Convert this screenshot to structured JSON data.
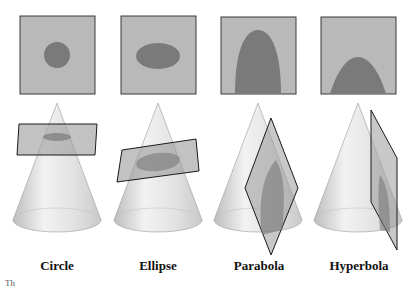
{
  "colors": {
    "panel_fill": "#b9b9b9",
    "panel_border": "#3a3a3a",
    "section_fill": "#7a7a7a",
    "cone_light": "#efefef",
    "cone_dark": "#c4c4c4",
    "plane_fill": "#9a9a9a",
    "plane_border": "#1a1a1a"
  },
  "sections": [
    {
      "id": "circle",
      "label": "Circle"
    },
    {
      "id": "ellipse",
      "label": "Ellipse"
    },
    {
      "id": "parabola",
      "label": "Parabola"
    },
    {
      "id": "hyperbola",
      "label": "Hyperbola"
    }
  ],
  "footer_stub": "Th"
}
